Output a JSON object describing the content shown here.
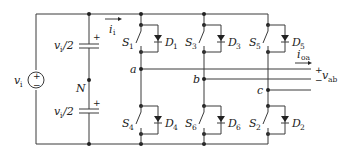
{
  "diagram": {
    "source": {
      "label": "v",
      "sub": "i",
      "polarity_plus": "+",
      "polarity_minus": "−"
    },
    "capacitors": [
      {
        "label": "v",
        "sub": "i",
        "suffix": "/2",
        "plus": "+"
      },
      {
        "label": "v",
        "sub": "i",
        "suffix": "/2",
        "plus": "+"
      }
    ],
    "neutral": {
      "label": "N"
    },
    "input_current": {
      "label": "i",
      "sub": "i"
    },
    "upper_switches": [
      {
        "s": "S",
        "s_sub": "1",
        "d": "D",
        "d_sub": "1"
      },
      {
        "s": "S",
        "s_sub": "3",
        "d": "D",
        "d_sub": "3"
      },
      {
        "s": "S",
        "s_sub": "5",
        "d": "D",
        "d_sub": "5"
      }
    ],
    "lower_switches": [
      {
        "s": "S",
        "s_sub": "4",
        "d": "D",
        "d_sub": "4"
      },
      {
        "s": "S",
        "s_sub": "6",
        "d": "D",
        "d_sub": "6"
      },
      {
        "s": "S",
        "s_sub": "2",
        "d": "D",
        "d_sub": "2"
      }
    ],
    "nodes": {
      "a": "a",
      "b": "b",
      "c": "c"
    },
    "output_current": {
      "label": "i",
      "sub": "oa"
    },
    "output_voltage": {
      "label": "v",
      "sub": "ab",
      "plus": "+",
      "minus": "−"
    },
    "colors": {
      "wire": "#3a3a3a",
      "text": "#222222",
      "background": "#ffffff"
    }
  }
}
